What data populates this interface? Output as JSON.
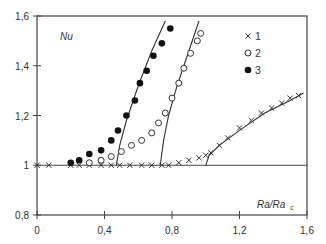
{
  "chart_data": {
    "type": "scatter",
    "title": "",
    "xlabel": "Ra/Ra",
    "xlabel_subscript": "c",
    "ylabel": "Nu",
    "xlim": [
      0,
      1.6
    ],
    "ylim": [
      0.8,
      1.6
    ],
    "x_ticks": [
      "0",
      "0,4",
      "0,8",
      "1,2",
      "1,6"
    ],
    "x_tick_values": [
      0,
      0.4,
      0.8,
      1.2,
      1.6
    ],
    "y_ticks": [
      "0,8",
      "1",
      "1,2",
      "1,4",
      "1,6"
    ],
    "y_tick_values": [
      0.8,
      1.0,
      1.2,
      1.4,
      1.6
    ],
    "grid": false,
    "reference_line_y": 1.0,
    "legend": {
      "position": "upper right",
      "entries": [
        {
          "marker": "cross",
          "label": "1"
        },
        {
          "marker": "open-circle",
          "label": "2"
        },
        {
          "marker": "filled-circle",
          "label": "3"
        }
      ]
    },
    "series": [
      {
        "name": "1",
        "marker": "cross",
        "points": [
          [
            0.0,
            1.0
          ],
          [
            0.07,
            1.0
          ],
          [
            0.2,
            1.0
          ],
          [
            0.25,
            1.0
          ],
          [
            0.31,
            1.0
          ],
          [
            0.38,
            1.0
          ],
          [
            0.44,
            1.0
          ],
          [
            0.49,
            1.0
          ],
          [
            0.55,
            1.0
          ],
          [
            0.62,
            1.0
          ],
          [
            0.68,
            1.0
          ],
          [
            0.74,
            1.0
          ],
          [
            0.78,
            1.0
          ],
          [
            0.84,
            1.01
          ],
          [
            0.9,
            1.02
          ],
          [
            0.96,
            1.03
          ],
          [
            1.0,
            1.04
          ],
          [
            1.03,
            1.05
          ],
          [
            1.08,
            1.08
          ],
          [
            1.13,
            1.11
          ],
          [
            1.2,
            1.15
          ],
          [
            1.27,
            1.18
          ],
          [
            1.33,
            1.21
          ],
          [
            1.39,
            1.23
          ],
          [
            1.45,
            1.25
          ],
          [
            1.5,
            1.27
          ],
          [
            1.55,
            1.28
          ]
        ]
      },
      {
        "name": "2",
        "marker": "open-circle",
        "points": [
          [
            0.31,
            1.01
          ],
          [
            0.38,
            1.02
          ],
          [
            0.44,
            1.035
          ],
          [
            0.5,
            1.055
          ],
          [
            0.56,
            1.08
          ],
          [
            0.62,
            1.1
          ],
          [
            0.68,
            1.13
          ],
          [
            0.72,
            1.17
          ],
          [
            0.76,
            1.21
          ],
          [
            0.8,
            1.27
          ],
          [
            0.84,
            1.33
          ],
          [
            0.87,
            1.39
          ],
          [
            0.91,
            1.45
          ],
          [
            0.95,
            1.5
          ],
          [
            0.97,
            1.53
          ]
        ]
      },
      {
        "name": "3",
        "marker": "filled-circle",
        "points": [
          [
            0.2,
            1.01
          ],
          [
            0.25,
            1.02
          ],
          [
            0.31,
            1.045
          ],
          [
            0.38,
            1.06
          ],
          [
            0.44,
            1.1
          ],
          [
            0.48,
            1.14
          ],
          [
            0.53,
            1.2
          ],
          [
            0.58,
            1.26
          ],
          [
            0.61,
            1.33
          ],
          [
            0.65,
            1.38
          ],
          [
            0.69,
            1.44
          ],
          [
            0.74,
            1.49
          ],
          [
            0.79,
            1.55
          ]
        ]
      }
    ],
    "fit_lines": [
      {
        "for_series": "3",
        "points": [
          [
            0.47,
            1.0
          ],
          [
            0.49,
            1.08
          ],
          [
            0.53,
            1.18
          ],
          [
            0.6,
            1.32
          ],
          [
            0.68,
            1.46
          ],
          [
            0.76,
            1.58
          ]
        ]
      },
      {
        "for_series": "2",
        "points": [
          [
            0.73,
            1.0
          ],
          [
            0.75,
            1.1
          ],
          [
            0.78,
            1.2
          ],
          [
            0.83,
            1.32
          ],
          [
            0.9,
            1.46
          ],
          [
            0.96,
            1.58
          ]
        ]
      },
      {
        "for_series": "1",
        "points": [
          [
            1.0,
            1.0
          ],
          [
            1.02,
            1.04
          ],
          [
            1.08,
            1.08
          ],
          [
            1.2,
            1.14
          ],
          [
            1.35,
            1.21
          ],
          [
            1.5,
            1.26
          ],
          [
            1.58,
            1.29
          ]
        ]
      }
    ]
  }
}
